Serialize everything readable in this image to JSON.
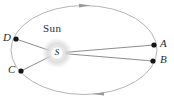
{
  "figure": {
    "sun_label": "Sun",
    "sun_symbol": "S",
    "point_labels": {
      "d": "D",
      "c": "C",
      "a": "A",
      "b": "B"
    },
    "colors": {
      "orbit_stroke": "#b5b5b5",
      "arrow_fill": "#9a9a9a",
      "radial_line": "#808080",
      "point_dot": "#141414",
      "label_text": "#2b2b2b",
      "sun_glow": "#d8d8d8"
    }
  }
}
